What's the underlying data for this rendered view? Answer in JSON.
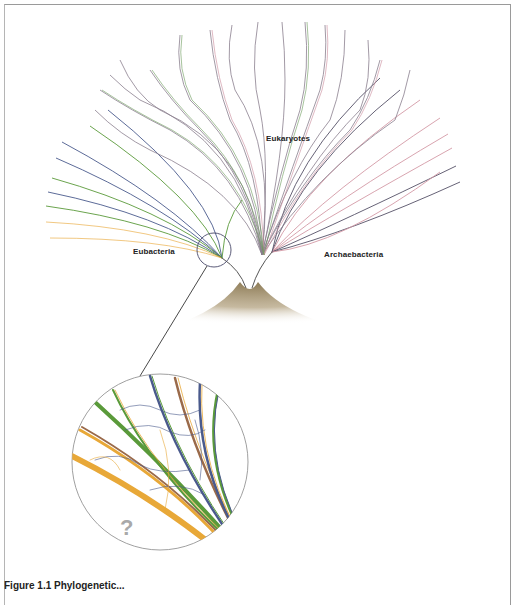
{
  "figure": {
    "type": "phylogenetic-tree-diagram",
    "labels": {
      "eukaryotes": "Eukaryotes",
      "eubacteria": "Eubacteria",
      "archaebacteria": "Archaebacteria",
      "unknown": "?"
    },
    "caption": "Figure 1.1 Phylogenetic..."
  },
  "colors": {
    "eukaryote_lines": "#8a7f8e",
    "eukaryote_accent_green": "#6b9a5a",
    "eukaryote_accent_pink": "#c98a9a",
    "bacteria_blue": "#4a5a8c",
    "bacteria_green": "#5a9a3a",
    "bacteria_orange": "#e8a838",
    "bacteria_brown": "#9a6a4a",
    "archaea_pink": "#d49aa6",
    "archaea_dark": "#555066",
    "root_base": "#a8987a",
    "magnifier_ring": "#888888",
    "frame": "#9a9a9a"
  }
}
